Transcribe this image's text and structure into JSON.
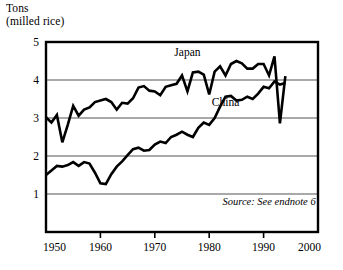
{
  "chart_data": {
    "type": "line",
    "title": "",
    "ylabel": "Tons\n(milled rice)",
    "xlabel": "",
    "xlim": [
      1950,
      2000
    ],
    "ylim": [
      0,
      5
    ],
    "xticks": [
      1950,
      1960,
      1970,
      1980,
      1990,
      2000
    ],
    "yticks": [
      1,
      2,
      3,
      4,
      5
    ],
    "grid": "horizontal",
    "legend": "inline-labels",
    "annotations": [
      {
        "text": "Japan",
        "x": 1976,
        "y": 4.62
      },
      {
        "text": "China",
        "x": 1983,
        "y": 3.32
      },
      {
        "text": "Source: See endnote 6",
        "x": 1991,
        "y": 0.72
      }
    ],
    "series": [
      {
        "name": "Japan",
        "x": [
          1950,
          1951,
          1952,
          1953,
          1954,
          1955,
          1956,
          1957,
          1958,
          1959,
          1960,
          1961,
          1962,
          1963,
          1964,
          1965,
          1966,
          1967,
          1968,
          1969,
          1970,
          1971,
          1972,
          1973,
          1974,
          1975,
          1976,
          1977,
          1978,
          1979,
          1980,
          1981,
          1982,
          1983,
          1984,
          1985,
          1986,
          1987,
          1988,
          1989,
          1990,
          1991,
          1992,
          1993,
          1994
        ],
        "values": [
          3.02,
          2.88,
          3.08,
          2.36,
          2.82,
          3.32,
          3.06,
          3.22,
          3.28,
          3.42,
          3.46,
          3.5,
          3.42,
          3.22,
          3.4,
          3.38,
          3.52,
          3.8,
          3.84,
          3.72,
          3.7,
          3.6,
          3.82,
          3.86,
          3.9,
          4.12,
          3.7,
          4.2,
          4.22,
          4.14,
          3.62,
          4.22,
          4.36,
          4.12,
          4.42,
          4.5,
          4.44,
          4.3,
          4.3,
          4.42,
          4.42,
          4.12,
          4.62,
          2.86,
          4.1
        ]
      },
      {
        "name": "China",
        "x": [
          1950,
          1951,
          1952,
          1953,
          1954,
          1955,
          1956,
          1957,
          1958,
          1959,
          1960,
          1961,
          1962,
          1963,
          1964,
          1965,
          1966,
          1967,
          1968,
          1969,
          1970,
          1971,
          1972,
          1973,
          1974,
          1975,
          1976,
          1977,
          1978,
          1979,
          1980,
          1981,
          1982,
          1983,
          1984,
          1985,
          1986,
          1987,
          1988,
          1989,
          1990,
          1991,
          1992,
          1993,
          1994
        ],
        "values": [
          1.5,
          1.62,
          1.74,
          1.72,
          1.76,
          1.84,
          1.74,
          1.84,
          1.8,
          1.56,
          1.28,
          1.26,
          1.52,
          1.72,
          1.86,
          2.02,
          2.18,
          2.22,
          2.14,
          2.16,
          2.3,
          2.38,
          2.34,
          2.5,
          2.56,
          2.64,
          2.56,
          2.5,
          2.74,
          2.88,
          2.82,
          3.0,
          3.3,
          3.56,
          3.58,
          3.46,
          3.48,
          3.56,
          3.5,
          3.64,
          3.82,
          3.78,
          3.96,
          3.88,
          3.92
        ]
      }
    ]
  }
}
